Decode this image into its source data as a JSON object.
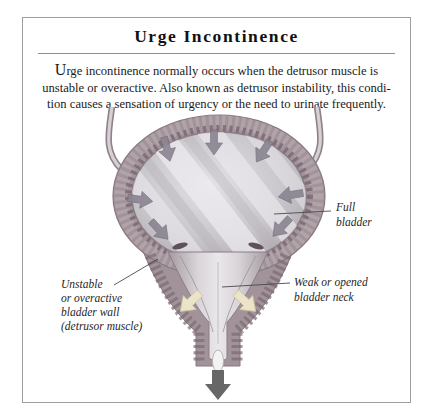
{
  "card": {
    "title": "Urge Incontinence",
    "description_lines": [
      "Urge incontinence normally occurs when the detrusor muscle is",
      "unstable or overactive. Also known as detrusor instability, this condi-",
      "tion causes a sensation of urgency or the need to urinate frequently."
    ]
  },
  "figure": {
    "labels": {
      "full_bladder": [
        "Full",
        "bladder"
      ],
      "bladder_wall": [
        "Unstable",
        "or overactive",
        "bladder wall",
        "(detrusor muscle)"
      ],
      "bladder_neck": [
        "Weak or opened",
        "bladder neck"
      ]
    },
    "colors": {
      "wall": "#a2939a",
      "wall_outer_texture": "#b3a6ab",
      "wall_inner_texture": "#74636c",
      "contraction_arrow": "#8b8692",
      "leak_arrow": "#ebe4c9",
      "flow_arrow": "#676767",
      "leader_line": "#4a4a4a"
    }
  }
}
